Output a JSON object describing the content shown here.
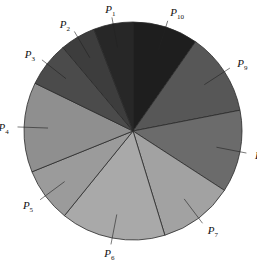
{
  "chart_data": {
    "type": "pie",
    "title": "",
    "start_angle_deg": 0,
    "direction": "clockwise",
    "slices": [
      {
        "label": "P10",
        "base": "P",
        "sub": "10",
        "degrees": 35,
        "value": 9.7,
        "color": "#1e1e1e"
      },
      {
        "label": "P9",
        "base": "P",
        "sub": "9",
        "degrees": 44,
        "value": 12.2,
        "color": "#575757"
      },
      {
        "label": "P8",
        "base": "P",
        "sub": "8",
        "degrees": 44,
        "value": 12.2,
        "color": "#6b6b6b"
      },
      {
        "label": "P7",
        "base": "P",
        "sub": "7",
        "degrees": 40,
        "value": 11.1,
        "color": "#a2a2a2"
      },
      {
        "label": "P6",
        "base": "P",
        "sub": "6",
        "degrees": 56,
        "value": 15.6,
        "color": "#a9a9a9"
      },
      {
        "label": "P5",
        "base": "P",
        "sub": "5",
        "degrees": 29,
        "value": 8.1,
        "color": "#9b9b9b"
      },
      {
        "label": "P4",
        "base": "P",
        "sub": "4",
        "degrees": 48,
        "value": 13.3,
        "color": "#8f8f8f"
      },
      {
        "label": "P3",
        "base": "P",
        "sub": "3",
        "degrees": 24,
        "value": 6.7,
        "color": "#4b4b4b"
      },
      {
        "label": "P2",
        "base": "P",
        "sub": "2",
        "degrees": 19,
        "value": 5.3,
        "color": "#3d3d3d"
      },
      {
        "label": "P1",
        "base": "P",
        "sub": "1",
        "degrees": 21,
        "value": 5.8,
        "color": "#272727"
      }
    ],
    "legend": "none",
    "labels_outside_with_leader_lines": true
  },
  "geometry": {
    "cx": 133,
    "cy": 131,
    "r": 109
  }
}
